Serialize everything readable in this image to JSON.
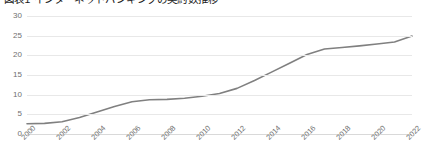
{
  "chart_data": {
    "type": "line",
    "title": "図表1 インターネットバンキングの契約数推移",
    "xlabel": "",
    "ylabel": "",
    "grid": true,
    "legend": false,
    "legend_position": "none",
    "xlim": [
      2000,
      2022
    ],
    "ylim": [
      0,
      30
    ],
    "yticks": [
      0,
      5,
      10,
      15,
      20,
      25,
      30
    ],
    "xticks": [
      2000,
      2002,
      2004,
      2006,
      2008,
      2010,
      2012,
      2014,
      2016,
      2018,
      2020,
      2022
    ],
    "xtick_labels": [
      "2000",
      "2002",
      "2004",
      "2006",
      "2008",
      "2010",
      "2012",
      "2014",
      "2016",
      "2018",
      "2020",
      "2022"
    ],
    "ytick_labels": [
      "0",
      "5",
      "10",
      "15",
      "20",
      "25",
      "30"
    ],
    "line_color": "#808080",
    "x": [
      2000,
      2001,
      2002,
      2003,
      2004,
      2005,
      2006,
      2007,
      2008,
      2009,
      2010,
      2011,
      2012,
      2013,
      2014,
      2015,
      2016,
      2017,
      2018,
      2019,
      2020,
      2021,
      2022
    ],
    "values": [
      2.6,
      2.7,
      3.1,
      4.2,
      5.6,
      7.0,
      8.2,
      8.7,
      8.8,
      9.1,
      9.6,
      10.3,
      11.6,
      13.6,
      15.8,
      18.0,
      20.2,
      21.6,
      22.0,
      22.4,
      22.9,
      23.4,
      24.9
    ],
    "series": [
      {
        "name": "契約数",
        "values": [
          2.6,
          2.7,
          3.1,
          4.2,
          5.6,
          7.0,
          8.2,
          8.7,
          8.8,
          9.1,
          9.6,
          10.3,
          11.6,
          13.6,
          15.8,
          18.0,
          20.2,
          21.6,
          22.0,
          22.4,
          22.9,
          23.4,
          24.9
        ]
      }
    ]
  }
}
